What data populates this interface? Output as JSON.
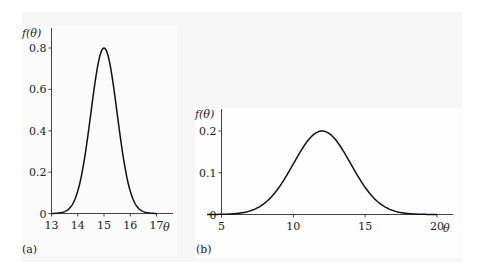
{
  "chart_data": [
    {
      "type": "line",
      "panel_label": "(a)",
      "title": "",
      "xlabel": "θ",
      "ylabel": "f(θ)",
      "x_ticks": [
        "13",
        "14",
        "15",
        "16",
        "17"
      ],
      "y_ticks": [
        "0",
        "0.2",
        "0.4",
        "0.6",
        "0.8"
      ],
      "xlim": [
        13,
        17.6
      ],
      "ylim": [
        0,
        0.85
      ],
      "distribution": {
        "kind": "normal",
        "mean": 15,
        "sd": 0.5
      },
      "peak": {
        "x": 15,
        "y": 0.8
      },
      "grid": false,
      "legend": null
    },
    {
      "type": "line",
      "panel_label": "(b)",
      "title": "",
      "xlabel": "θ",
      "ylabel": "f(θ)",
      "x_ticks": [
        "5",
        "10",
        "15",
        "20"
      ],
      "y_ticks": [
        "0",
        "0.1",
        "0.2"
      ],
      "xlim": [
        5,
        21.1
      ],
      "ylim": [
        0,
        0.25
      ],
      "distribution": {
        "kind": "normal",
        "mean": 12,
        "sd": 2
      },
      "peak": {
        "x": 12,
        "y": 0.2
      },
      "grid": false,
      "legend": null
    }
  ],
  "labels": {
    "a": {
      "ylabel": "f(θ)",
      "xlabel": "θ",
      "panel": "(a)"
    },
    "b": {
      "ylabel": "f(θ)",
      "xlabel": "θ",
      "panel": "(b)"
    }
  }
}
